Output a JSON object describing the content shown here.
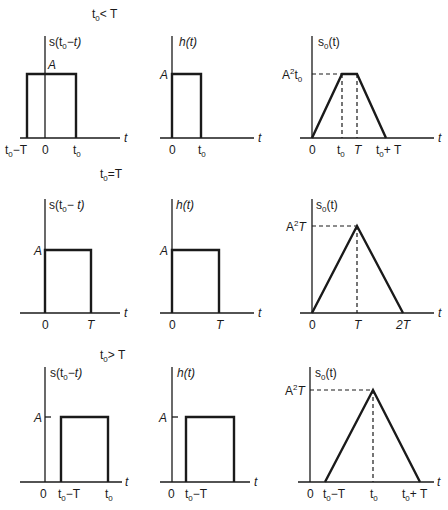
{
  "figure": {
    "columns": [
      "s(t0 - t)",
      "h(t)",
      "s0(t)"
    ],
    "rows": [
      {
        "case_label": "t0 < T",
        "panel_s": {
          "ylabel": "s(t0 - t)",
          "amp_label": "A",
          "xticks": [
            "t0 - T",
            "0",
            "t0"
          ],
          "xaxis": "t"
        },
        "panel_h": {
          "ylabel": "h(t)",
          "amp_label": "A",
          "xticks": [
            "0",
            "t0"
          ],
          "xaxis": "t"
        },
        "panel_s0": {
          "ylabel": "s0(t)",
          "peak_label": "A²t0",
          "shape": "trapezoid",
          "xticks": [
            "0",
            "t0",
            "T",
            "t0 + T"
          ],
          "xaxis": "t"
        }
      },
      {
        "case_label": "t0 = T",
        "panel_s": {
          "ylabel": "s(t0 - t)",
          "amp_label": "A",
          "xticks": [
            "0",
            "T"
          ],
          "xaxis": "t"
        },
        "panel_h": {
          "ylabel": "h(t)",
          "amp_label": "A",
          "xticks": [
            "0",
            "T"
          ],
          "xaxis": "t"
        },
        "panel_s0": {
          "ylabel": "s0(t)",
          "peak_label": "A²T",
          "shape": "triangle",
          "xticks": [
            "0",
            "T",
            "2T"
          ],
          "xaxis": "t"
        }
      },
      {
        "case_label": "t0 > T",
        "panel_s": {
          "ylabel": "s(t0 - t)",
          "amp_label": "A",
          "xticks": [
            "0",
            "t0 - T",
            "t0"
          ],
          "xaxis": "t"
        },
        "panel_h": {
          "ylabel": "h(t)",
          "amp_label": "A",
          "xticks": [
            "0",
            "t0 - T"
          ],
          "xaxis": "t"
        },
        "panel_s0": {
          "ylabel": "s0(t)",
          "peak_label": "A²T",
          "shape": "triangle",
          "xticks": [
            "0",
            "t0 - T",
            "t0",
            "t0 + T"
          ],
          "xaxis": "t"
        }
      }
    ]
  }
}
